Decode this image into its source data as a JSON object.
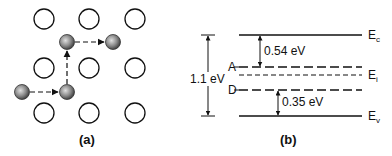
{
  "panel_a": {
    "caption": "(a)",
    "lattice_sites": [
      {
        "cx": 44,
        "cy": 19
      },
      {
        "cx": 89,
        "cy": 19
      },
      {
        "cx": 135,
        "cy": 19
      },
      {
        "cx": 44,
        "cy": 68
      },
      {
        "cx": 89,
        "cy": 68
      },
      {
        "cx": 135,
        "cy": 68
      },
      {
        "cx": 44,
        "cy": 113
      },
      {
        "cx": 89,
        "cy": 113
      },
      {
        "cx": 135,
        "cy": 113
      }
    ],
    "diffusing_atoms": [
      {
        "cx": 22,
        "cy": 92
      },
      {
        "cx": 67,
        "cy": 92
      },
      {
        "cx": 67,
        "cy": 42
      },
      {
        "cx": 113,
        "cy": 42
      }
    ]
  },
  "panel_b": {
    "caption": "(b)",
    "levels": {
      "Ec": {
        "main": "E",
        "sub": "c"
      },
      "Ei": {
        "main": "E",
        "sub": "i"
      },
      "Ev": {
        "main": "E",
        "sub": "v"
      },
      "A": "A",
      "D": "D"
    },
    "gap_label": "1.1 eV",
    "acceptor_gap": "0.54 eV",
    "donor_gap": "0.35 eV"
  }
}
